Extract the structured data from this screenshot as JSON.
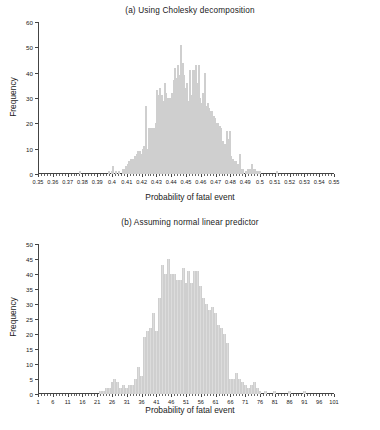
{
  "figure": {
    "background": "#ffffff",
    "bar_color": "#dcdcdc",
    "axis_color": "#444444",
    "text_color": "#1a1a1a"
  },
  "chart_data": [
    {
      "type": "bar",
      "panel": "a",
      "title": "(a) Using Cholesky decomposition",
      "xlabel": "Probability of fatal event",
      "ylabel": "Frequency",
      "grid": false,
      "legend": "none",
      "xlim": [
        0.35,
        0.55
      ],
      "ylim": [
        0,
        60
      ],
      "ytick_labels": [
        "0",
        "10",
        "20",
        "30",
        "40",
        "50",
        "60"
      ],
      "ytick_values": [
        0,
        10,
        20,
        30,
        40,
        50,
        60
      ],
      "xtick_labels": [
        "0.35",
        "0.36",
        "0.37",
        "0.38",
        "0.39",
        "0.4",
        "0.41",
        "0.42",
        "0.43",
        "0.44",
        "0.45",
        "0.46",
        "0.47",
        "0.48",
        "0.49",
        "0.5",
        "0.51",
        "0.52",
        "0.53",
        "0.54",
        "0.55"
      ],
      "xtick_values": [
        0.35,
        0.36,
        0.37,
        0.38,
        0.39,
        0.4,
        0.41,
        0.42,
        0.43,
        0.44,
        0.45,
        0.46,
        0.47,
        0.48,
        0.49,
        0.5,
        0.51,
        0.52,
        0.53,
        0.54,
        0.55
      ],
      "bin_width": 0.001,
      "x": [
        0.3505,
        0.3515,
        0.3525,
        0.3535,
        0.3545,
        0.3555,
        0.3565,
        0.3575,
        0.3585,
        0.3595,
        0.3605,
        0.3615,
        0.3625,
        0.3635,
        0.3645,
        0.3655,
        0.3665,
        0.3675,
        0.3685,
        0.3695,
        0.3705,
        0.3715,
        0.3725,
        0.3735,
        0.3745,
        0.3755,
        0.3765,
        0.3775,
        0.3785,
        0.3795,
        0.3805,
        0.3815,
        0.3825,
        0.3835,
        0.3845,
        0.3855,
        0.3865,
        0.3875,
        0.3885,
        0.3895,
        0.3905,
        0.3915,
        0.3925,
        0.3935,
        0.3945,
        0.3955,
        0.3965,
        0.3975,
        0.3985,
        0.3995,
        0.4005,
        0.4015,
        0.4025,
        0.4035,
        0.4045,
        0.4055,
        0.4065,
        0.4075,
        0.4085,
        0.4095,
        0.4105,
        0.4115,
        0.4125,
        0.4135,
        0.4145,
        0.4155,
        0.4165,
        0.4175,
        0.4185,
        0.4195,
        0.4205,
        0.4215,
        0.4225,
        0.4235,
        0.4245,
        0.4255,
        0.4265,
        0.4275,
        0.4285,
        0.4295,
        0.4305,
        0.4315,
        0.4325,
        0.4335,
        0.4345,
        0.4355,
        0.4365,
        0.4375,
        0.4385,
        0.4395,
        0.4405,
        0.4415,
        0.4425,
        0.4435,
        0.4445,
        0.4455,
        0.4465,
        0.4475,
        0.4485,
        0.4495,
        0.4505,
        0.4515,
        0.4525,
        0.4535,
        0.4545,
        0.4555,
        0.4565,
        0.4575,
        0.4585,
        0.4595,
        0.4605,
        0.4615,
        0.4625,
        0.4635,
        0.4645,
        0.4655,
        0.4665,
        0.4675,
        0.4685,
        0.4695,
        0.4705,
        0.4715,
        0.4725,
        0.4735,
        0.4745,
        0.4755,
        0.4765,
        0.4775,
        0.4785,
        0.4795,
        0.4805,
        0.4815,
        0.4825,
        0.4835,
        0.4845,
        0.4855,
        0.4865,
        0.4875,
        0.4885,
        0.4895,
        0.4905,
        0.4915,
        0.4925,
        0.4935,
        0.4945,
        0.4955,
        0.4965,
        0.4975,
        0.4985,
        0.4995,
        0.5005,
        0.5015,
        0.5025,
        0.5035,
        0.5045,
        0.5055,
        0.5065,
        0.5075,
        0.5085,
        0.5095,
        0.5105,
        0.5115,
        0.5125,
        0.5135,
        0.5145,
        0.5155,
        0.5165,
        0.5175,
        0.5185,
        0.5195
      ],
      "values": [
        0,
        0,
        0,
        0,
        0,
        0,
        0,
        0,
        0,
        0,
        0,
        0,
        0,
        0,
        0,
        0,
        0,
        0,
        0,
        0,
        0,
        0,
        0,
        0,
        0,
        0,
        0,
        0,
        1,
        0,
        0,
        0,
        0,
        0,
        0,
        0,
        0,
        0,
        0,
        0,
        0,
        0,
        0,
        0,
        0,
        0,
        0,
        1,
        0,
        1,
        3,
        0,
        1,
        0,
        1,
        0,
        0,
        2,
        2,
        3,
        4,
        5,
        6,
        6,
        6,
        7,
        8,
        9,
        9,
        8,
        10,
        11,
        27,
        10,
        18,
        18,
        18,
        18,
        18,
        20,
        33,
        31,
        34,
        31,
        29,
        36,
        32,
        30,
        30,
        30,
        32,
        37,
        42,
        38,
        43,
        39,
        51,
        44,
        39,
        34,
        36,
        29,
        41,
        31,
        41,
        41,
        43,
        36,
        43,
        30,
        28,
        32,
        40,
        27,
        28,
        26,
        25,
        25,
        23,
        22,
        20,
        20,
        19,
        18,
        13,
        12,
        12,
        17,
        14,
        17,
        7,
        6,
        5,
        5,
        4,
        4,
        8,
        2,
        2,
        0,
        1,
        2,
        2,
        2,
        4,
        2,
        2,
        1,
        1,
        1,
        0,
        0,
        0,
        0,
        0,
        0,
        0,
        0,
        0,
        0,
        0,
        1,
        0,
        0,
        0,
        0,
        0,
        0,
        0,
        0
      ]
    },
    {
      "type": "bar",
      "panel": "b",
      "title": "(b) Assuming normal linear predictor",
      "xlabel": "Probability of fatal event",
      "ylabel": "Frequency",
      "grid": false,
      "legend": "none",
      "xlim": [
        1,
        101
      ],
      "ylim": [
        0,
        50
      ],
      "ytick_labels": [
        "0",
        "5",
        "10",
        "15",
        "20",
        "25",
        "30",
        "35",
        "40",
        "45",
        "50"
      ],
      "ytick_values": [
        0,
        5,
        10,
        15,
        20,
        25,
        30,
        35,
        40,
        45,
        50
      ],
      "xtick_labels": [
        "1",
        "6",
        "11",
        "16",
        "21",
        "26",
        "31",
        "36",
        "41",
        "46",
        "51",
        "56",
        "61",
        "66",
        "71",
        "76",
        "81",
        "86",
        "91",
        "96",
        "101"
      ],
      "xtick_values": [
        1,
        6,
        11,
        16,
        21,
        26,
        31,
        36,
        41,
        46,
        51,
        56,
        61,
        66,
        71,
        76,
        81,
        86,
        91,
        96,
        101
      ],
      "bin_width": 1,
      "x": [
        1,
        2,
        3,
        4,
        5,
        6,
        7,
        8,
        9,
        10,
        11,
        12,
        13,
        14,
        15,
        16,
        17,
        18,
        19,
        20,
        21,
        22,
        23,
        24,
        25,
        26,
        27,
        28,
        29,
        30,
        31,
        32,
        33,
        34,
        35,
        36,
        37,
        38,
        39,
        40,
        41,
        42,
        43,
        44,
        45,
        46,
        47,
        48,
        49,
        50,
        51,
        52,
        53,
        54,
        55,
        56,
        57,
        58,
        59,
        60,
        61,
        62,
        63,
        64,
        65,
        66,
        67,
        68,
        69,
        70,
        71,
        72,
        73,
        74,
        75,
        76,
        77,
        78,
        79,
        80,
        81,
        82,
        83,
        84,
        85,
        86,
        87,
        88,
        89,
        90,
        91,
        92,
        93,
        94,
        95,
        96,
        97,
        98,
        99,
        100,
        101
      ],
      "values": [
        0,
        0,
        0,
        0,
        0,
        0,
        0,
        0,
        0,
        0,
        0,
        0,
        0,
        0,
        0,
        0,
        0,
        0,
        0,
        0,
        0,
        1,
        1,
        2,
        2,
        4,
        5,
        4,
        2,
        3,
        2,
        3,
        3,
        5,
        9,
        6,
        19,
        21,
        22,
        27,
        21,
        32,
        43,
        40,
        45,
        40,
        40,
        38,
        38,
        42,
        37,
        41,
        37,
        41,
        41,
        36,
        32,
        30,
        28,
        29,
        27,
        23,
        22,
        20,
        17,
        5,
        5,
        7,
        5,
        4,
        3,
        2,
        3,
        4,
        2,
        1,
        0,
        1,
        0,
        0,
        1,
        0,
        0,
        0,
        0,
        1,
        0,
        0,
        0,
        0,
        1,
        0,
        0,
        0,
        0,
        0,
        0,
        0,
        0,
        0,
        0
      ]
    }
  ]
}
